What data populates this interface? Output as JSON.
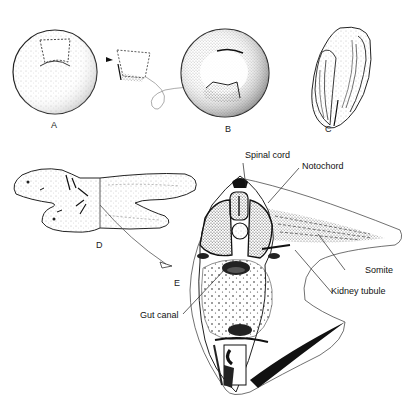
{
  "figure": {
    "panels": [
      {
        "id": "A",
        "label": "A",
        "description": "Donor embryo with dorsal lip region outlined"
      },
      {
        "id": "transplant",
        "label": "",
        "description": "Excised dorsal lip fragment being transplanted"
      },
      {
        "id": "B",
        "label": "B",
        "description": "Host embryo receiving graft"
      },
      {
        "id": "C",
        "label": "C",
        "description": "Embryo developing secondary axis"
      },
      {
        "id": "D",
        "label": "D",
        "description": "Conjoined twin larvae"
      },
      {
        "id": "E",
        "label": "E",
        "description": "Cross-section of secondary embryo"
      }
    ],
    "annotations": [
      {
        "id": "spinal-cord",
        "text": "Spinal cord"
      },
      {
        "id": "notochord",
        "text": "Notochord"
      },
      {
        "id": "somite",
        "text": "Somite"
      },
      {
        "id": "kidney-tubule",
        "text": "Kidney tubule"
      },
      {
        "id": "gut-canal",
        "text": "Gut canal"
      }
    ],
    "colors": {
      "ink": "#1a1a1a",
      "stipple": "#555555",
      "background": "#ffffff"
    }
  }
}
